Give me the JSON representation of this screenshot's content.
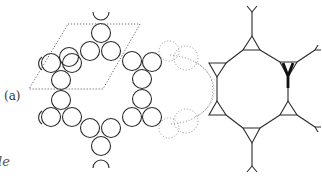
{
  "figure": {
    "panel_label": "(a)",
    "edge_text": "le",
    "colors": {
      "ink": "#2a2a2a",
      "dotted": "#777777",
      "background": "#ffffff"
    },
    "left_lattice": {
      "description": "kagome-like ring of touching circles with dotted rhombic unit cell",
      "circle_radius": 9.5
    },
    "right_network": {
      "description": "octagonal ring of triangles connected by lines with Y-shaped terminals",
      "highlighted_vertex": "thick Y at right-top triangle"
    }
  }
}
